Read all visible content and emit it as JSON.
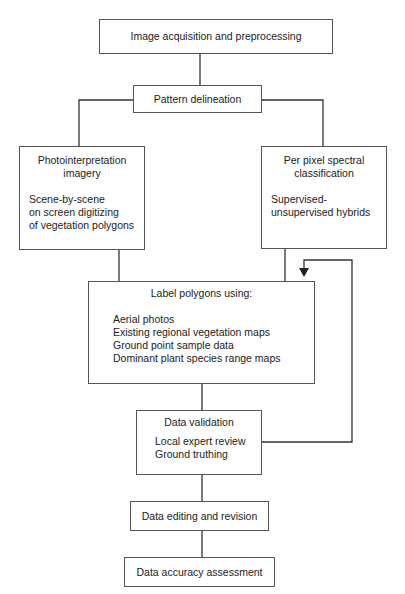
{
  "diagram": {
    "nodes": {
      "acquisition": {
        "label": "Image acquisition and preprocessing"
      },
      "pattern": {
        "label": "Pattern delineation"
      },
      "photo": {
        "title": "Photointerpretation imagery",
        "title_line1": "Photointerpretation",
        "title_line2": "imagery",
        "body_lines": [
          "Scene-by-scene",
          "on screen digitizing",
          "of vegetation polygons"
        ]
      },
      "spectral": {
        "title_line1": "Per pixel spectral",
        "title_line2": "classification",
        "body_lines": [
          "Supervised-",
          "unsupervised hybrids"
        ]
      },
      "label": {
        "title": "Label polygons using:",
        "items": [
          "Aerial photos",
          "Existing regional vegetation maps",
          "Ground point sample data",
          "Dominant plant species range maps"
        ]
      },
      "validation": {
        "title": "Data validation",
        "items": [
          "Local expert review",
          "Ground truthing"
        ]
      },
      "editing": {
        "label": "Data editing and revision"
      },
      "accuracy": {
        "label": "Data accuracy assessment"
      }
    },
    "edges": [
      {
        "from": "acquisition",
        "to": "pattern"
      },
      {
        "from": "pattern",
        "to": "photo"
      },
      {
        "from": "pattern",
        "to": "spectral"
      },
      {
        "from": "photo",
        "to": "label"
      },
      {
        "from": "spectral",
        "to": "label"
      },
      {
        "from": "label",
        "to": "validation"
      },
      {
        "from": "validation",
        "to": "label",
        "type": "feedback-arrow"
      },
      {
        "from": "validation",
        "to": "editing"
      },
      {
        "from": "editing",
        "to": "accuracy"
      }
    ],
    "colors": {
      "line": "#333333",
      "border": "#555555",
      "text": "#222222"
    }
  }
}
